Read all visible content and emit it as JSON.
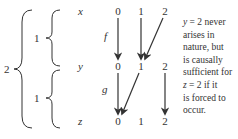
{
  "diagram": {
    "group_labels": {
      "outer": "2",
      "inner_top": "1",
      "inner_bottom": "1"
    },
    "variables": [
      "x",
      "y",
      "z"
    ],
    "values": [
      "0",
      "1",
      "2"
    ],
    "functions": [
      {
        "name": "f",
        "from": "x",
        "to": "y",
        "mapping": [
          [
            0,
            0
          ],
          [
            1,
            1
          ],
          [
            2,
            1
          ]
        ]
      },
      {
        "name": "g",
        "from": "y",
        "to": "z",
        "mapping": [
          [
            0,
            0
          ],
          [
            1,
            0
          ],
          [
            2,
            2
          ]
        ]
      }
    ],
    "annotation": {
      "lines": [
        "y = 2 never",
        "arises in",
        "nature, but",
        "is causally",
        "sufficient for",
        "z = 2 if it",
        "is forced to",
        "occur."
      ]
    },
    "colors": {
      "ink": "#333333",
      "background": "#ffffff"
    }
  }
}
